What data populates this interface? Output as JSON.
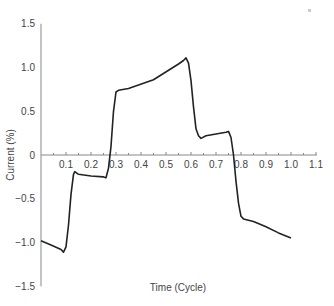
{
  "chart_data": {
    "type": "line",
    "title": "",
    "xlabel": "Time (Cycle)",
    "ylabel": "Current (%)",
    "xlim": [
      0,
      1.1
    ],
    "ylim": [
      -1.5,
      1.5
    ],
    "grid": false,
    "legend": null,
    "x_ticks": [
      "0.1",
      "0.2",
      "0.3",
      "0.4",
      "0.5",
      "0.6",
      "0.7",
      "0.8",
      "0.9",
      "1.0",
      "1.1"
    ],
    "y_ticks": [
      "1.5",
      "1.0",
      "0.5",
      "0",
      "-0.5",
      "-1.0",
      "-1.5"
    ],
    "series": [
      {
        "name": "current",
        "color": "#222222",
        "x": [
          0.0,
          0.04,
          0.08,
          0.09,
          0.1,
          0.11,
          0.12,
          0.13,
          0.135,
          0.15,
          0.2,
          0.25,
          0.26,
          0.27,
          0.28,
          0.29,
          0.3,
          0.31,
          0.35,
          0.45,
          0.55,
          0.57,
          0.58,
          0.59,
          0.6,
          0.61,
          0.62,
          0.63,
          0.64,
          0.66,
          0.7,
          0.74,
          0.75,
          0.76,
          0.77,
          0.78,
          0.79,
          0.8,
          0.81,
          0.85,
          0.9,
          0.95,
          1.0
        ],
        "y": [
          -0.98,
          -1.03,
          -1.08,
          -1.11,
          -1.05,
          -0.8,
          -0.45,
          -0.22,
          -0.19,
          -0.22,
          -0.24,
          -0.25,
          -0.26,
          -0.15,
          0.1,
          0.5,
          0.72,
          0.74,
          0.76,
          0.86,
          1.04,
          1.08,
          1.11,
          1.05,
          0.85,
          0.55,
          0.3,
          0.22,
          0.19,
          0.22,
          0.24,
          0.26,
          0.27,
          0.2,
          0.0,
          -0.3,
          -0.55,
          -0.7,
          -0.73,
          -0.76,
          -0.82,
          -0.89,
          -0.95
        ]
      }
    ]
  },
  "annotations": {
    "corner_mark": "·"
  }
}
